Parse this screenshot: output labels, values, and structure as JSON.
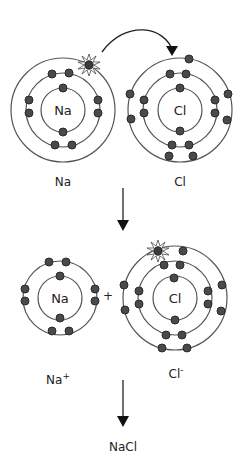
{
  "colors": {
    "shell": "#555555",
    "electron": "#4a4a4a",
    "electron_stroke": "#2a2a2a",
    "text": "#222222",
    "arrow": "#111111"
  },
  "atoms": {
    "na": {
      "symbol": "Na",
      "label": "Na",
      "shells": [
        2,
        8,
        1
      ]
    },
    "cl": {
      "symbol": "Cl",
      "label": "Cl",
      "shells": [
        2,
        8,
        7
      ]
    },
    "na_ion": {
      "symbol": "Na",
      "label": "Na",
      "charge": "+",
      "shells": [
        2,
        8
      ]
    },
    "cl_ion": {
      "symbol": "Cl",
      "label": "Cl",
      "charge": "-",
      "shells": [
        2,
        8,
        8
      ]
    }
  },
  "plus_sign": "+",
  "product": "NaCl",
  "annotations": {
    "transferred_electron": "highlighted electron (starburst) moves from Na outer shell to Cl outer shell"
  }
}
